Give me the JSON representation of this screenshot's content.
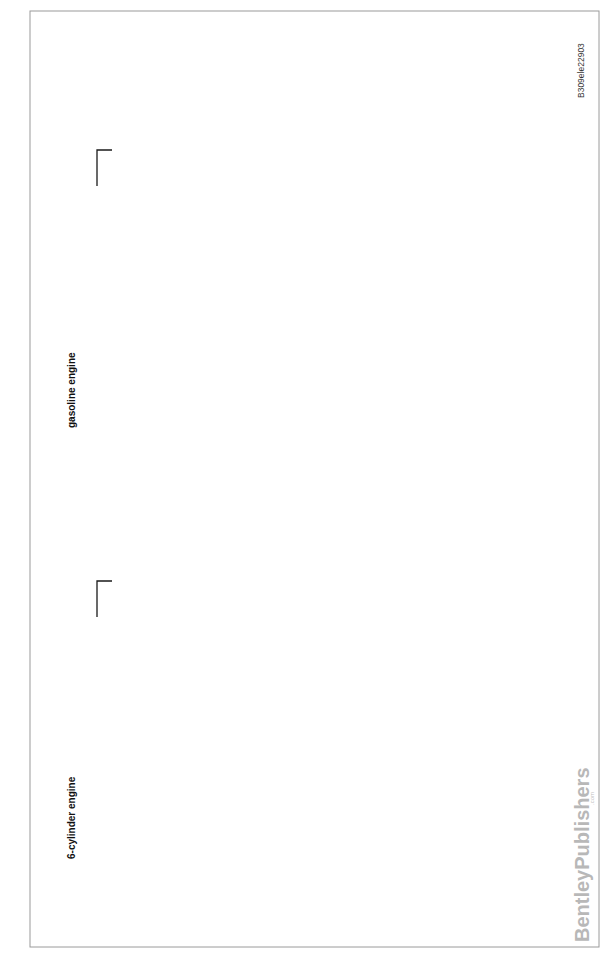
{
  "document": {
    "figure_id": "B309ele22903",
    "publisher_watermark": "BentleyPublishers",
    "publisher_watermark_suffix": ".com"
  },
  "diagrams": [
    {
      "title": "gasoline engine",
      "page_ref": "25938",
      "ground_connector": "X6402",
      "battery": {
        "id": "G1",
        "name": "Battery",
        "pin_neg": "X6406",
        "pin_pos": "X1369",
        "neg_sign": "−",
        "pos_sign": "+"
      },
      "b_terminal": {
        "id": "I01121",
        "name_l1": "B+ terminal",
        "name_l2": "point, luggage",
        "name_l3": "well",
        "pin_in": "X01185",
        "pin_out": "X18090"
      },
      "wire_80": {
        "size": "80.0",
        "color": "RT"
      },
      "jump_start": {
        "id": "G6430",
        "name_l1": "Jump",
        "name_l2": "start terminal",
        "name_l3": "point",
        "terminal": "30",
        "pin_in": "X10272",
        "pin_out": "X6404"
      },
      "wire_25_starter": {
        "size": "25.0",
        "color": "RT"
      },
      "starter": {
        "id": "M6510a",
        "name": "Starter",
        "pin": "X6512",
        "motor_label": "M"
      },
      "battery_sensor": {
        "id": "B895",
        "name_l1": "Battery",
        "name_l2": "sensor",
        "pin_fuse": "X9230",
        "pin_in": "X13895",
        "pin_out": "X13895",
        "pin_in_num": "3",
        "pin_out_num": "1",
        "pin_fuse_num": "1"
      },
      "fuse_holder": {
        "id": "A46",
        "name_l1": "Fuse holder, rear",
        "name_l2": "",
        "name_l3": "",
        "fuse": "F105",
        "pin_out": "X18261"
      },
      "wire_35": {
        "size": "35.0",
        "color": "RT"
      },
      "feed_connector": "X10547",
      "wire_sense": {
        "size": "0.35",
        "color": "RT/GN"
      },
      "splice": "X11241",
      "wire_dme": {
        "size": "0.5",
        "color": "GR"
      },
      "dme": {
        "id": "A6000",
        "name_l1": "DME",
        "name_l2": "control",
        "name_l3": "module",
        "pin_in": "X60001",
        "pin_out": "X60005",
        "pin_in_num": "3",
        "pin_out_num": "35"
      },
      "alt_signal_connector": "X6038",
      "wire_alt_signal": {
        "size": "0.75",
        "color": "GR"
      },
      "alternator": {
        "id": "G6524",
        "name": "Alternator",
        "pin_b": "X6509",
        "pin_sig": "X6524",
        "pin_sig_num": "1",
        "ground_terminal": "31"
      },
      "wire_25_alt": {
        "size": "25.0",
        "color": "RT"
      }
    },
    {
      "title": "6-cylinder engine",
      "page_ref": "22903",
      "ground_connector": "X6402",
      "battery": {
        "id": "G1",
        "name": "Battery",
        "pin_neg": "X6406",
        "pin_pos": "X1369",
        "neg_sign": "−",
        "pos_sign": "+"
      },
      "b_terminal": {
        "id": "I01121",
        "name_l1": "B+ terminal",
        "name_l2": "point, luggage",
        "name_l3": "well",
        "pin_in": "X01185",
        "pin_out": "X18090"
      },
      "wire_80": {
        "size": "80.0",
        "color": "RT"
      },
      "jump_start": {
        "id": "G6430",
        "name_l1": "Jump",
        "name_l2": "start terminal",
        "name_l3": "point",
        "terminal": "30",
        "pin_in": "X10272",
        "pin_out": "X6404"
      },
      "wire_25_starter": {
        "size": "25.0",
        "color": "RT"
      },
      "starter": {
        "id": "M6510a",
        "name": "Starter",
        "pin": "X6512",
        "motor_label": "M"
      },
      "battery_sensor": {
        "id": "B895",
        "name_l1": "Battery",
        "name_l2": "sensor",
        "pin_fuse": "X9230",
        "pin_in": "X13895",
        "pin_out": "X13895",
        "pin_in_num": "3",
        "pin_out_num": "1",
        "pin_fuse_num": "1"
      },
      "fuse_holder": {
        "id": "A46",
        "name_l1": "Fuse",
        "name_l2": "holder,",
        "name_l3": "rear",
        "fuse": "F104",
        "pin_out": "X18261"
      },
      "wire_35": {
        "size": "35.0",
        "color": "RT"
      },
      "feed_connector": "X10547",
      "wire_sense": {
        "size": "0.35",
        "color": "RT/GN"
      },
      "splice": "X11241",
      "wire_dme": {
        "size": "0.5",
        "color": "GR"
      },
      "dme": {
        "id": "A6000",
        "name_l1": "DME",
        "name_l2": "control",
        "name_l3": "module",
        "pin_in": "X60001",
        "pin_out": "X60005",
        "pin_in_num": "3",
        "pin_out_num": "35"
      },
      "alt_signal_connector": "X6038",
      "wire_alt_signal": {
        "size": "0.5",
        "color": "VI"
      },
      "alternator": {
        "id": "G6524",
        "name": "Alternator",
        "pin_b": "X6509",
        "pin_sig": "X6524",
        "pin_sig_num": "1",
        "ground_terminal": "31"
      },
      "wire_25_alt": {
        "size": "25.0",
        "color": "RT"
      }
    }
  ]
}
